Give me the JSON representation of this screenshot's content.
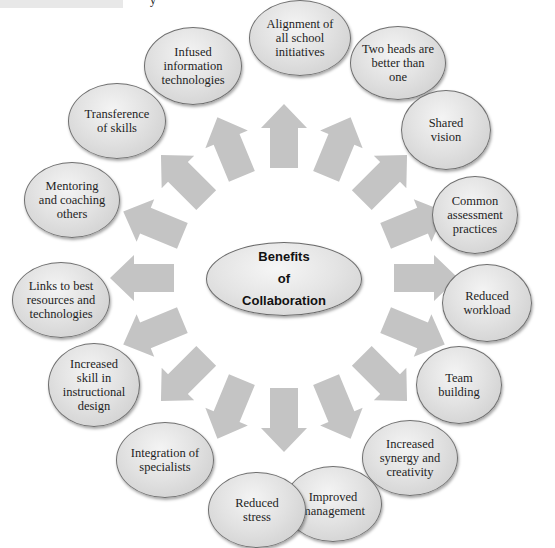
{
  "header": {
    "glyph": "y"
  },
  "diagram": {
    "title_lines": [
      "Benefits",
      "of",
      "Collaboration"
    ],
    "colors": {
      "arrow": "#c4c4c4",
      "bubble_border": "#6f6f6f",
      "bubble_fill": "#e2e2e2",
      "text": "#1e1e1e"
    },
    "benefits": [
      {
        "label": "Alignment of all school initiatives"
      },
      {
        "label": "Two heads are better than one"
      },
      {
        "label": "Shared vision"
      },
      {
        "label": "Common assessment practices"
      },
      {
        "label": "Reduced workload"
      },
      {
        "label": "Team building"
      },
      {
        "label": "Increased synergy and creativity"
      },
      {
        "label": "Improved management"
      },
      {
        "label": "Reduced stress"
      },
      {
        "label": "Integration of specialists"
      },
      {
        "label": "Increased skill in instructional design"
      },
      {
        "label": "Links to best resources and technologies"
      },
      {
        "label": "Mentoring and coaching others"
      },
      {
        "label": "Transference of skills"
      },
      {
        "label": "Infused information technologies"
      }
    ]
  }
}
